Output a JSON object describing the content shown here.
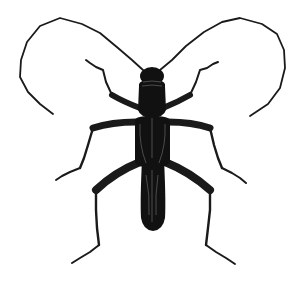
{
  "image": {
    "subject": "longhorn beetle",
    "style": "black ink scientific illustration",
    "background": "#ffffff",
    "ink": "#111111",
    "highlight": "#5a5a5a"
  }
}
